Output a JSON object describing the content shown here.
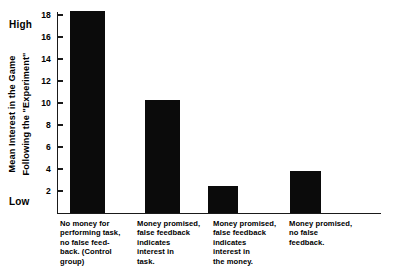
{
  "chart_data": {
    "type": "bar",
    "title": "",
    "subtitle": "",
    "xlabel": "",
    "ylabel": "Mean Interest in the Game Following the \"Experiment\"",
    "ylabel_lines": [
      "Mean Interest in the Game",
      "Following the \"Experiment\""
    ],
    "ylim": [
      0,
      19.5
    ],
    "axis_anchor_high": "High",
    "axis_anchor_low": "Low",
    "grid": false,
    "legend": "none",
    "ytick_labels": [
      "18",
      "16",
      "14",
      "12",
      "10",
      "8",
      "6",
      "4",
      "2"
    ],
    "ytick_values": [
      18,
      16,
      14,
      12,
      10,
      8,
      6,
      4,
      2
    ],
    "categories": [
      "No money for\nperforming task,\nno false feed-\nback. (Control\ngroup)",
      "Money promised,\nfalse feedback\nindicates\ninterest in\ntask.",
      "Money promised,\nfalse feedback\nindicates\ninterest in\nthe money.",
      "Money promised,\nno false\nfeedback."
    ],
    "values": [
      18.4,
      10.3,
      2.5,
      3.8
    ],
    "bar_color": "#0b0b0b",
    "axis_color": "#1a1a1a",
    "background_color": "#ffffff"
  }
}
